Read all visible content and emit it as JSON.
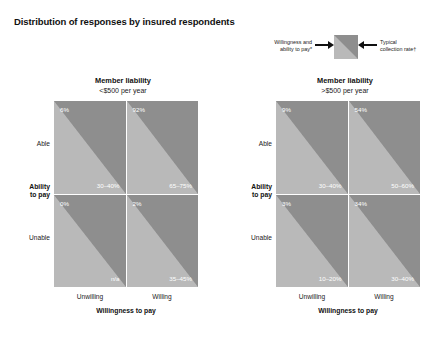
{
  "title": "Distribution of responses by insured respondents",
  "legend": {
    "left_label": "Willingness and\nability to pay*",
    "left_label_line1": "Willingness and",
    "left_label_line2": "ability to pay*",
    "right_label_line1": "Typical",
    "right_label_line2": "collection rate†",
    "swatch_upper_color": "#b9b9b9",
    "swatch_lower_color": "#8e8e8e"
  },
  "axes": {
    "y_title_line1": "Ability",
    "y_title_line2": "to pay",
    "y_ticks": [
      "Able",
      "Unable"
    ],
    "x_title": "Willingness to pay",
    "x_ticks": [
      "Unwilling",
      "Willing"
    ]
  },
  "chart_data": {
    "type": "heatmap",
    "title": "Distribution of responses by insured respondents",
    "xlabel": "Willingness to pay",
    "ylabel": "Ability to pay",
    "categories_x": [
      "Unwilling",
      "Willing"
    ],
    "categories_y": [
      "Able",
      "Unable"
    ],
    "legend": [
      "Willingness and ability to pay*",
      "Typical collection rate†"
    ],
    "panels": [
      {
        "header_line1": "Member liability",
        "header_line2": "<$500 per year",
        "cells": [
          {
            "y": "Able",
            "x": "Unwilling",
            "willingness_ability": "6%",
            "collection_rate": "30–40%"
          },
          {
            "y": "Able",
            "x": "Willing",
            "willingness_ability": "92%",
            "collection_rate": "65–75%"
          },
          {
            "y": "Unable",
            "x": "Unwilling",
            "willingness_ability": "0%",
            "collection_rate": "n/a"
          },
          {
            "y": "Unable",
            "x": "Willing",
            "willingness_ability": "2%",
            "collection_rate": "35–45%"
          }
        ]
      },
      {
        "header_line1": "Member liability",
        "header_line2": ">$500 per year",
        "cells": [
          {
            "y": "Able",
            "x": "Unwilling",
            "willingness_ability": "9%",
            "collection_rate": "30–40%"
          },
          {
            "y": "Able",
            "x": "Willing",
            "willingness_ability": "54%",
            "collection_rate": "50–60%"
          },
          {
            "y": "Unable",
            "x": "Unwilling",
            "willingness_ability": "3%",
            "collection_rate": "10–20%"
          },
          {
            "y": "Unable",
            "x": "Willing",
            "willingness_ability": "34%",
            "collection_rate": "30–40%"
          }
        ]
      }
    ]
  }
}
